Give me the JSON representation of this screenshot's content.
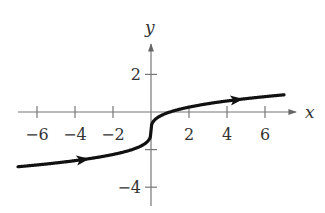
{
  "chart_data": {
    "type": "line",
    "title": "",
    "function": "y = cbrt(x) - 1",
    "xlabel": "x",
    "ylabel": "y",
    "xlim": [
      -7,
      7
    ],
    "ylim": [
      -5,
      3.5
    ],
    "x_ticks": [
      -6,
      -4,
      -2,
      2,
      4,
      6
    ],
    "x_tick_labels": [
      "−6",
      "−4",
      "−2",
      "2",
      "4",
      "6"
    ],
    "y_ticks": [
      2,
      -2,
      -4
    ],
    "y_tick_labels": [
      "2",
      "−4"
    ],
    "grid": false,
    "legend": null,
    "series": [
      {
        "name": "curve",
        "x": [
          -7,
          -6,
          -5,
          -4,
          -3,
          -2,
          -1,
          -0.5,
          -0.1,
          0,
          0.1,
          0.5,
          1,
          2,
          3,
          4,
          5,
          6,
          7
        ],
        "values": [
          -2.91,
          -2.82,
          -2.71,
          -2.59,
          -2.44,
          -2.26,
          -2.0,
          -1.79,
          -1.46,
          -1.0,
          -0.54,
          -0.21,
          0.0,
          0.26,
          0.44,
          0.59,
          0.71,
          0.82,
          0.91
        ]
      }
    ],
    "annotations": [
      "direction arrow near x=-3.5 pointing right",
      "direction arrow near x=4.5 pointing right"
    ]
  },
  "axes": {
    "x_label": "x",
    "y_label": "y"
  }
}
